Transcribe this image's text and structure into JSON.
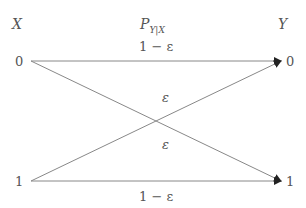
{
  "diagram": {
    "input_label": "X",
    "output_label": "Y",
    "channel_label_main": "P",
    "channel_label_sub": "Y|X",
    "inputs": [
      "0",
      "1"
    ],
    "outputs": [
      "0",
      "1"
    ],
    "edges": [
      {
        "from": "0",
        "to": "0",
        "label": "1 − ε"
      },
      {
        "from": "0",
        "to": "1",
        "label": "ε"
      },
      {
        "from": "1",
        "to": "0",
        "label": "ε"
      },
      {
        "from": "1",
        "to": "1",
        "label": "1 − ε"
      }
    ],
    "line_color": "#888888"
  }
}
